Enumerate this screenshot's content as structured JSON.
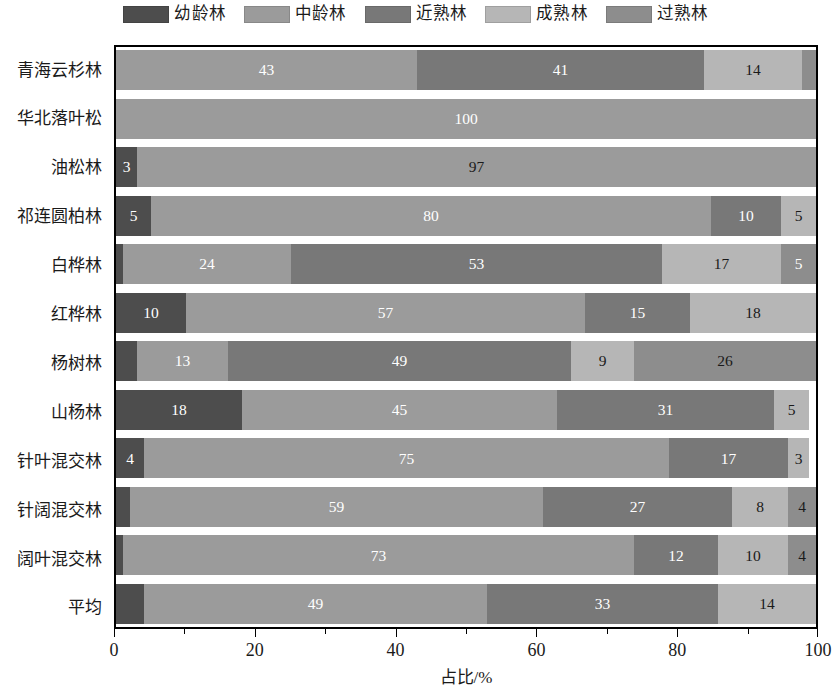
{
  "legend": {
    "items": [
      {
        "label": "幼龄林",
        "color": "#4d4d4d",
        "key": "young"
      },
      {
        "label": "中龄林",
        "color": "#9b9b9b",
        "key": "middle"
      },
      {
        "label": "近熟林",
        "color": "#787878",
        "key": "near_mature"
      },
      {
        "label": "成熟林",
        "color": "#b6b6b6",
        "key": "mature"
      },
      {
        "label": "过熟林",
        "color": "#8d8d8d",
        "key": "over_mature"
      }
    ]
  },
  "axis": {
    "x_ticks": [
      "0",
      "20",
      "40",
      "60",
      "80",
      "100"
    ],
    "x_title": "占比/%"
  },
  "chart_data": {
    "type": "bar",
    "orientation": "horizontal",
    "stacked": true,
    "title": "",
    "xlabel": "占比/%",
    "ylabel": "",
    "xlim": [
      0,
      100
    ],
    "grid": false,
    "legend_position": "top",
    "categories": [
      "青海云杉林",
      "华北落叶松",
      "油松林",
      "祁连圆柏林",
      "白桦林",
      "红桦林",
      "杨树林",
      "山杨林",
      "针叶混交林",
      "针阔混交林",
      "阔叶混交林",
      "平均"
    ],
    "series": [
      {
        "name": "幼龄林",
        "color": "#4d4d4d",
        "values": [
          0,
          0,
          3,
          5,
          1,
          10,
          3,
          18,
          4,
          2,
          1,
          4
        ]
      },
      {
        "name": "中龄林",
        "color": "#9b9b9b",
        "values": [
          43,
          100,
          97,
          80,
          24,
          57,
          13,
          45,
          75,
          59,
          73,
          49
        ]
      },
      {
        "name": "近熟林",
        "color": "#787878",
        "values": [
          41,
          0,
          0,
          10,
          53,
          15,
          49,
          31,
          17,
          27,
          12,
          33
        ]
      },
      {
        "name": "成熟林",
        "color": "#b6b6b6",
        "values": [
          14,
          0,
          0,
          5,
          17,
          18,
          9,
          5,
          3,
          8,
          10,
          14
        ]
      },
      {
        "name": "过熟林",
        "color": "#8d8d8d",
        "values": [
          0,
          0,
          0,
          0,
          5,
          0,
          26,
          0,
          0,
          4,
          4,
          0
        ]
      }
    ],
    "label_min_visible": 3,
    "rows": [
      {
        "category": "青海云杉林",
        "segments": [
          {
            "series": "中龄林",
            "value": 43,
            "label": "43",
            "color": "#9b9b9b",
            "text": "#ffffff"
          },
          {
            "series": "近熟林",
            "value": 41,
            "label": "41",
            "color": "#787878",
            "text": "#ffffff"
          },
          {
            "series": "成熟林",
            "value": 14,
            "label": "14",
            "color": "#b6b6b6",
            "text": "#1a1a1a"
          },
          {
            "series": "过熟林",
            "value": 2,
            "label": "",
            "color": "#8d8d8d",
            "text": "#ffffff"
          }
        ]
      },
      {
        "category": "华北落叶松",
        "segments": [
          {
            "series": "中龄林",
            "value": 100,
            "label": "100",
            "color": "#9b9b9b",
            "text": "#ffffff"
          }
        ]
      },
      {
        "category": "油松林",
        "segments": [
          {
            "series": "幼龄林",
            "value": 3,
            "label": "3",
            "color": "#4d4d4d",
            "text": "#ffffff"
          },
          {
            "series": "中龄林",
            "value": 97,
            "label": "97",
            "color": "#9b9b9b",
            "text": "#1a1a1a"
          }
        ]
      },
      {
        "category": "祁连圆柏林",
        "segments": [
          {
            "series": "幼龄林",
            "value": 5,
            "label": "5",
            "color": "#4d4d4d",
            "text": "#ffffff"
          },
          {
            "series": "中龄林",
            "value": 80,
            "label": "80",
            "color": "#9b9b9b",
            "text": "#ffffff"
          },
          {
            "series": "近熟林",
            "value": 10,
            "label": "10",
            "color": "#787878",
            "text": "#ffffff"
          },
          {
            "series": "成熟林",
            "value": 5,
            "label": "5",
            "color": "#b6b6b6",
            "text": "#1a1a1a"
          }
        ]
      },
      {
        "category": "白桦林",
        "segments": [
          {
            "series": "幼龄林",
            "value": 1,
            "label": "",
            "color": "#4d4d4d",
            "text": "#ffffff"
          },
          {
            "series": "中龄林",
            "value": 24,
            "label": "24",
            "color": "#9b9b9b",
            "text": "#ffffff"
          },
          {
            "series": "近熟林",
            "value": 53,
            "label": "53",
            "color": "#787878",
            "text": "#ffffff"
          },
          {
            "series": "成熟林",
            "value": 17,
            "label": "17",
            "color": "#b6b6b6",
            "text": "#1a1a1a"
          },
          {
            "series": "过熟林",
            "value": 5,
            "label": "5",
            "color": "#8d8d8d",
            "text": "#ffffff"
          }
        ]
      },
      {
        "category": "红桦林",
        "segments": [
          {
            "series": "幼龄林",
            "value": 10,
            "label": "10",
            "color": "#4d4d4d",
            "text": "#ffffff"
          },
          {
            "series": "中龄林",
            "value": 57,
            "label": "57",
            "color": "#9b9b9b",
            "text": "#ffffff"
          },
          {
            "series": "近熟林",
            "value": 15,
            "label": "15",
            "color": "#787878",
            "text": "#ffffff"
          },
          {
            "series": "成熟林",
            "value": 18,
            "label": "18",
            "color": "#b6b6b6",
            "text": "#1a1a1a"
          }
        ]
      },
      {
        "category": "杨树林",
        "segments": [
          {
            "series": "幼龄林",
            "value": 3,
            "label": "",
            "color": "#4d4d4d",
            "text": "#ffffff"
          },
          {
            "series": "中龄林",
            "value": 13,
            "label": "13",
            "color": "#9b9b9b",
            "text": "#ffffff"
          },
          {
            "series": "近熟林",
            "value": 49,
            "label": "49",
            "color": "#787878",
            "text": "#ffffff"
          },
          {
            "series": "成熟林",
            "value": 9,
            "label": "9",
            "color": "#b6b6b6",
            "text": "#1a1a1a"
          },
          {
            "series": "过熟林",
            "value": 26,
            "label": "26",
            "color": "#8d8d8d",
            "text": "#1a1a1a"
          }
        ]
      },
      {
        "category": "山杨林",
        "segments": [
          {
            "series": "幼龄林",
            "value": 18,
            "label": "18",
            "color": "#4d4d4d",
            "text": "#ffffff"
          },
          {
            "series": "中龄林",
            "value": 45,
            "label": "45",
            "color": "#9b9b9b",
            "text": "#ffffff"
          },
          {
            "series": "近熟林",
            "value": 31,
            "label": "31",
            "color": "#787878",
            "text": "#ffffff"
          },
          {
            "series": "成熟林",
            "value": 5,
            "label": "5",
            "color": "#b6b6b6",
            "text": "#1a1a1a"
          }
        ]
      },
      {
        "category": "针叶混交林",
        "segments": [
          {
            "series": "幼龄林",
            "value": 4,
            "label": "4",
            "color": "#4d4d4d",
            "text": "#ffffff"
          },
          {
            "series": "中龄林",
            "value": 75,
            "label": "75",
            "color": "#9b9b9b",
            "text": "#ffffff"
          },
          {
            "series": "近熟林",
            "value": 17,
            "label": "17",
            "color": "#787878",
            "text": "#ffffff"
          },
          {
            "series": "成熟林",
            "value": 3,
            "label": "3",
            "color": "#b6b6b6",
            "text": "#1a1a1a"
          }
        ]
      },
      {
        "category": "针阔混交林",
        "segments": [
          {
            "series": "幼龄林",
            "value": 2,
            "label": "",
            "color": "#4d4d4d",
            "text": "#ffffff"
          },
          {
            "series": "中龄林",
            "value": 59,
            "label": "59",
            "color": "#9b9b9b",
            "text": "#ffffff"
          },
          {
            "series": "近熟林",
            "value": 27,
            "label": "27",
            "color": "#787878",
            "text": "#ffffff"
          },
          {
            "series": "成熟林",
            "value": 8,
            "label": "8",
            "color": "#b6b6b6",
            "text": "#1a1a1a"
          },
          {
            "series": "过熟林",
            "value": 4,
            "label": "4",
            "color": "#8d8d8d",
            "text": "#1a1a1a"
          }
        ]
      },
      {
        "category": "阔叶混交林",
        "segments": [
          {
            "series": "幼龄林",
            "value": 1,
            "label": "",
            "color": "#4d4d4d",
            "text": "#ffffff"
          },
          {
            "series": "中龄林",
            "value": 73,
            "label": "73",
            "color": "#9b9b9b",
            "text": "#ffffff"
          },
          {
            "series": "近熟林",
            "value": 12,
            "label": "12",
            "color": "#787878",
            "text": "#ffffff"
          },
          {
            "series": "成熟林",
            "value": 10,
            "label": "10",
            "color": "#b6b6b6",
            "text": "#1a1a1a"
          },
          {
            "series": "过熟林",
            "value": 4,
            "label": "4",
            "color": "#8d8d8d",
            "text": "#1a1a1a"
          }
        ]
      },
      {
        "category": "平均",
        "segments": [
          {
            "series": "幼龄林",
            "value": 4,
            "label": "",
            "color": "#4d4d4d",
            "text": "#ffffff"
          },
          {
            "series": "中龄林",
            "value": 49,
            "label": "49",
            "color": "#9b9b9b",
            "text": "#ffffff"
          },
          {
            "series": "近熟林",
            "value": 33,
            "label": "33",
            "color": "#787878",
            "text": "#ffffff"
          },
          {
            "series": "成熟林",
            "value": 14,
            "label": "14",
            "color": "#b6b6b6",
            "text": "#1a1a1a"
          }
        ]
      }
    ]
  }
}
